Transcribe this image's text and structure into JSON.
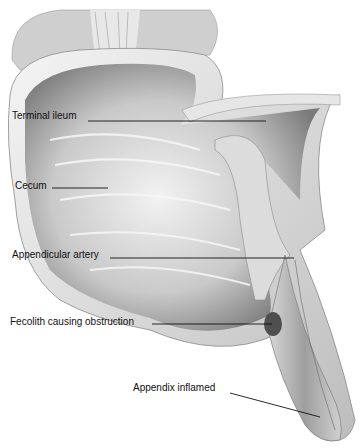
{
  "diagram": {
    "labels": [
      {
        "text": "Terminal ileum",
        "x": 12,
        "y": 110,
        "line": [
          88,
          121,
          266,
          121
        ]
      },
      {
        "text": "Cecum",
        "x": 15,
        "y": 180,
        "line": [
          52,
          188,
          108,
          188
        ]
      },
      {
        "text": "Appendicular artery",
        "x": 12,
        "y": 249,
        "line": [
          110,
          258,
          294,
          258
        ]
      },
      {
        "text": "Fecolith causing obstruction",
        "x": 10,
        "y": 316,
        "line": [
          152,
          324,
          272,
          324
        ]
      },
      {
        "text": "Appendix inflamed",
        "x": 133,
        "y": 382,
        "line": [
          230,
          393,
          320,
          417
        ]
      }
    ]
  }
}
